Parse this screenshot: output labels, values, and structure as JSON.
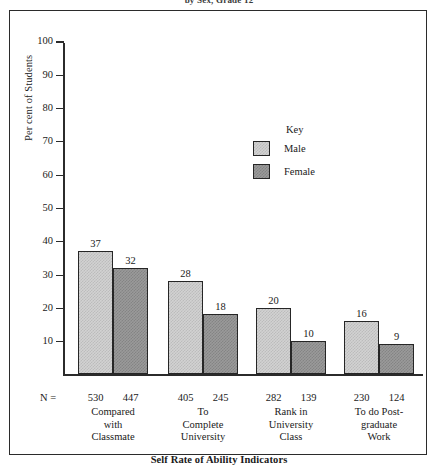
{
  "figure": {
    "caption": "by Sex, Grade 12",
    "y_axis_title": "Per cent of Students",
    "x_axis_title": "Self Rate of Ability Indicators",
    "n_prefix": "N ="
  },
  "legend": {
    "title": "Key",
    "entries": [
      {
        "label": "Male",
        "color": "#d2d2d2"
      },
      {
        "label": "Female",
        "color": "#9a9a9a"
      }
    ]
  },
  "chart_data": {
    "type": "bar",
    "title": "by Sex, Grade 12",
    "xlabel": "Self Rate of Ability Indicators",
    "ylabel": "Per cent of Students",
    "ylim": [
      0,
      100
    ],
    "yticks": [
      10,
      20,
      30,
      40,
      50,
      60,
      70,
      80,
      90,
      100
    ],
    "grid": false,
    "legend_position": "inside-upper-right",
    "categories": [
      "Compared with Classmate",
      "To Complete University",
      "Rank in University Class",
      "To do Post-graduate Work"
    ],
    "category_lines": [
      [
        "Compared",
        "with",
        "Classmate"
      ],
      [
        "To",
        "Complete",
        "University"
      ],
      [
        "Rank in",
        "University",
        "Class"
      ],
      [
        "To do Post-",
        "graduate",
        "Work"
      ]
    ],
    "series": [
      {
        "name": "Male",
        "color": "#d2d2d2",
        "values": [
          37,
          28,
          20,
          16
        ],
        "n": [
          530,
          405,
          282,
          230
        ]
      },
      {
        "name": "Female",
        "color": "#9a9a9a",
        "values": [
          32,
          18,
          10,
          9
        ],
        "n": [
          447,
          245,
          139,
          124
        ]
      }
    ]
  }
}
